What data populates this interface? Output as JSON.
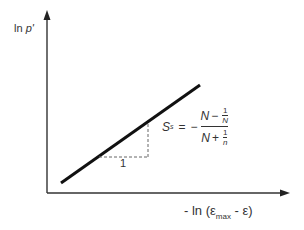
{
  "diagram": {
    "y_axis_label": "ln p'",
    "y_axis_label_main": "ln ",
    "y_axis_label_var": "p'",
    "x_axis_label": "- ln (εmax - ε)",
    "x_axis_prefix": "- ln (",
    "x_axis_eps1": "ε",
    "x_axis_sub": "max",
    "x_axis_mid": " - ",
    "x_axis_eps2": "ε",
    "x_axis_suffix": ")",
    "slope_triangle_run_label": "1",
    "equation": {
      "lhs": "S",
      "lhs_sub": "s",
      "equals": "=",
      "minus": "−",
      "numerator_N": "N",
      "numerator_op": "−",
      "numerator_frac_num": "1",
      "numerator_frac_den": "N",
      "denominator_N": "N",
      "denominator_op": "+",
      "denominator_frac_num": "1",
      "denominator_frac_den": "n"
    },
    "colors": {
      "line": "#111111",
      "axis": "#333333",
      "dashed": "#666666"
    }
  }
}
